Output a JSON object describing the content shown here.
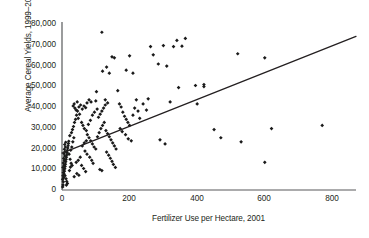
{
  "chart_data": {
    "type": "scatter",
    "title": "",
    "xlabel": "Fertilizer Use per Hectare, 2001",
    "ylabel": "Average Cereal Yields, 1999–2003",
    "xlim": [
      0,
      870
    ],
    "ylim": [
      0,
      82000
    ],
    "xticks": [
      "0",
      "200",
      "400",
      "600",
      "800"
    ],
    "xtick_values": [
      0,
      200,
      400,
      600,
      800
    ],
    "yticks": [
      "0",
      "10,000",
      "20,000",
      "30,000",
      "40,000",
      "50,000",
      "60,000",
      "70,000",
      "80,000"
    ],
    "ytick_values": [
      0,
      10000,
      20000,
      30000,
      40000,
      50000,
      60000,
      70000,
      80000
    ],
    "grid": false,
    "legend": null,
    "marker": "diamond",
    "marker_color": "#1a1a1a",
    "axis_color": "#58595b",
    "trendline": {
      "x": [
        0,
        870
      ],
      "y": [
        18000,
        75000
      ],
      "color": "#231f20"
    },
    "points": [
      [
        2,
        1500
      ],
      [
        3,
        2500
      ],
      [
        4,
        4000
      ],
      [
        2,
        5200
      ],
      [
        5,
        6000
      ],
      [
        3,
        7000
      ],
      [
        6,
        7800
      ],
      [
        4,
        8500
      ],
      [
        7,
        9200
      ],
      [
        5,
        9800
      ],
      [
        8,
        10400
      ],
      [
        3,
        11000
      ],
      [
        9,
        11500
      ],
      [
        6,
        12100
      ],
      [
        10,
        12600
      ],
      [
        4,
        13200
      ],
      [
        11,
        13800
      ],
      [
        7,
        14300
      ],
      [
        12,
        14900
      ],
      [
        5,
        15400
      ],
      [
        13,
        16000
      ],
      [
        8,
        16600
      ],
      [
        14,
        17100
      ],
      [
        6,
        17700
      ],
      [
        15,
        18200
      ],
      [
        9,
        18800
      ],
      [
        16,
        19400
      ],
      [
        7,
        19900
      ],
      [
        17,
        20500
      ],
      [
        10,
        21000
      ],
      [
        18,
        21600
      ],
      [
        8,
        22200
      ],
      [
        19,
        22700
      ],
      [
        11,
        23300
      ],
      [
        20,
        23800
      ],
      [
        9,
        7000
      ],
      [
        12,
        5500
      ],
      [
        14,
        4200
      ],
      [
        16,
        3200
      ],
      [
        13,
        2400
      ],
      [
        22,
        9500
      ],
      [
        25,
        11200
      ],
      [
        27,
        13000
      ],
      [
        30,
        12000
      ],
      [
        24,
        15000
      ],
      [
        21,
        17500
      ],
      [
        26,
        19500
      ],
      [
        29,
        21000
      ],
      [
        32,
        23500
      ],
      [
        35,
        25500
      ],
      [
        23,
        26500
      ],
      [
        28,
        28000
      ],
      [
        31,
        29500
      ],
      [
        34,
        31000
      ],
      [
        37,
        33000
      ],
      [
        40,
        34500
      ],
      [
        43,
        36500
      ],
      [
        46,
        38500
      ],
      [
        38,
        40000
      ],
      [
        42,
        39000
      ],
      [
        33,
        41000
      ],
      [
        36,
        42000
      ],
      [
        50,
        40500
      ],
      [
        55,
        41500
      ],
      [
        45,
        43000
      ],
      [
        60,
        39500
      ],
      [
        65,
        41000
      ],
      [
        70,
        40200
      ],
      [
        52,
        37000
      ],
      [
        48,
        35000
      ],
      [
        58,
        33000
      ],
      [
        62,
        31500
      ],
      [
        66,
        30000
      ],
      [
        72,
        29000
      ],
      [
        75,
        27000
      ],
      [
        80,
        25500
      ],
      [
        85,
        24000
      ],
      [
        90,
        22500
      ],
      [
        95,
        21000
      ],
      [
        100,
        20000
      ],
      [
        68,
        19000
      ],
      [
        74,
        17500
      ],
      [
        82,
        16000
      ],
      [
        88,
        14500
      ],
      [
        92,
        13000
      ],
      [
        105,
        26000
      ],
      [
        110,
        28000
      ],
      [
        115,
        30000
      ],
      [
        120,
        31500
      ],
      [
        125,
        33000
      ],
      [
        108,
        35500
      ],
      [
        113,
        37000
      ],
      [
        118,
        38500
      ],
      [
        123,
        40000
      ],
      [
        128,
        41500
      ],
      [
        130,
        29000
      ],
      [
        135,
        27500
      ],
      [
        140,
        26000
      ],
      [
        145,
        24500
      ],
      [
        150,
        23000
      ],
      [
        155,
        21500
      ],
      [
        160,
        20000
      ],
      [
        132,
        18500
      ],
      [
        138,
        17000
      ],
      [
        143,
        15500
      ],
      [
        148,
        14000
      ],
      [
        152,
        12500
      ],
      [
        158,
        11000
      ],
      [
        112,
        10000
      ],
      [
        118,
        9500
      ],
      [
        102,
        48000
      ],
      [
        120,
        58000
      ],
      [
        140,
        57000
      ],
      [
        148,
        65000
      ],
      [
        155,
        64500
      ],
      [
        128,
        44000
      ],
      [
        135,
        42500
      ],
      [
        165,
        48500
      ],
      [
        170,
        42000
      ],
      [
        175,
        40500
      ],
      [
        180,
        38000
      ],
      [
        185,
        36000
      ],
      [
        190,
        34500
      ],
      [
        195,
        33000
      ],
      [
        200,
        31500
      ],
      [
        172,
        30000
      ],
      [
        178,
        28500
      ],
      [
        188,
        27000
      ],
      [
        196,
        25000
      ],
      [
        205,
        24000
      ],
      [
        210,
        36500
      ],
      [
        215,
        40000
      ],
      [
        220,
        44000
      ],
      [
        225,
        38500
      ],
      [
        230,
        35000
      ],
      [
        240,
        42000
      ],
      [
        250,
        39000
      ],
      [
        255,
        44500
      ],
      [
        118,
        77000
      ],
      [
        132,
        60000
      ],
      [
        262,
        70000
      ],
      [
        270,
        66000
      ],
      [
        285,
        61500
      ],
      [
        300,
        70500
      ],
      [
        310,
        60500
      ],
      [
        330,
        70000
      ],
      [
        340,
        73000
      ],
      [
        355,
        70200
      ],
      [
        365,
        74000
      ],
      [
        345,
        50000
      ],
      [
        320,
        43000
      ],
      [
        290,
        24500
      ],
      [
        305,
        22500
      ],
      [
        395,
        51000
      ],
      [
        420,
        51500
      ],
      [
        400,
        42000
      ],
      [
        450,
        29500
      ],
      [
        470,
        25500
      ],
      [
        520,
        66500
      ],
      [
        600,
        64500
      ],
      [
        530,
        23500
      ],
      [
        620,
        30000
      ],
      [
        600,
        13500
      ],
      [
        770,
        31500
      ],
      [
        420,
        50500
      ],
      [
        58,
        12000
      ],
      [
        64,
        10500
      ],
      [
        70,
        9000
      ],
      [
        44,
        8000
      ],
      [
        50,
        7200
      ],
      [
        36,
        6500
      ],
      [
        42,
        13500
      ],
      [
        48,
        14500
      ],
      [
        54,
        16000
      ],
      [
        60,
        21500
      ],
      [
        66,
        23000
      ],
      [
        72,
        24000
      ],
      [
        78,
        32000
      ],
      [
        84,
        34000
      ],
      [
        90,
        36500
      ],
      [
        96,
        38000
      ],
      [
        100,
        43500
      ],
      [
        104,
        39500
      ],
      [
        86,
        43000
      ],
      [
        80,
        44000
      ],
      [
        74,
        42500
      ],
      [
        200,
        65500
      ],
      [
        210,
        57000
      ],
      [
        190,
        58500
      ]
    ]
  }
}
